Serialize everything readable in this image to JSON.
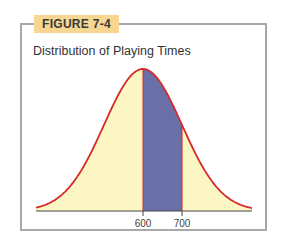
{
  "figure": {
    "label": "FIGURE 7-4",
    "title": "Distribution of Playing Times"
  },
  "colors": {
    "curve": "#d42a2a",
    "fill_light": "#fbf6c4",
    "fill_shaded": "#6b6fa8",
    "axis": "#444444",
    "frame": "#a8a8a8",
    "label_bg": "#f6d690"
  },
  "chart_data": {
    "type": "area",
    "title": "Distribution of Playing Times",
    "mean": 600,
    "sd_px_per_100": 39,
    "shaded_region": [
      600,
      700
    ],
    "xticks": [
      600,
      700
    ],
    "xtick_labels": [
      "600",
      "700"
    ],
    "xlabel": "",
    "ylabel": "",
    "grid": false,
    "legend": null
  }
}
